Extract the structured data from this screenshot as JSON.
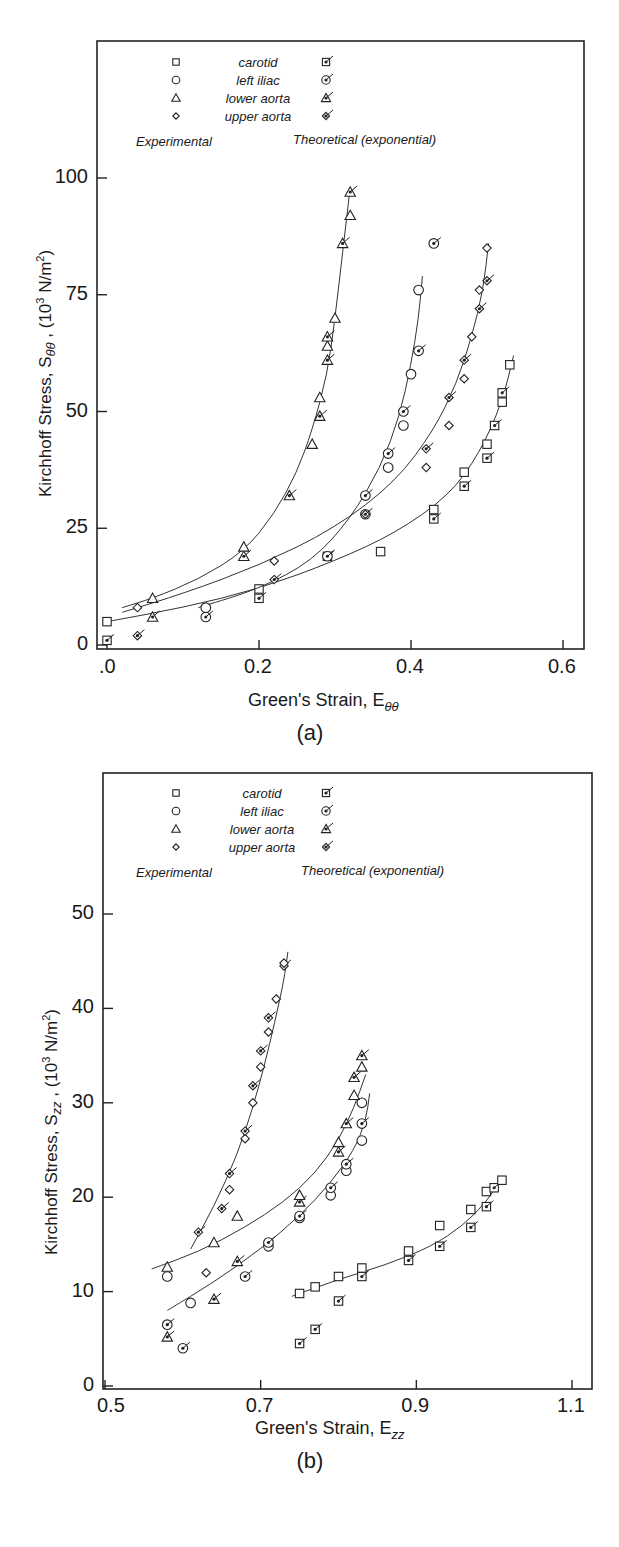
{
  "chart_data": [
    {
      "panel": "(a)",
      "type": "scatter",
      "title": "",
      "xlabel": "Green's Strain, Eθθ",
      "xlabel_main": "Green's Strain, E",
      "xlabel_sub": "θθ",
      "ylabel": "Kirchhoff Stress, Sθθ , (10³ N/m²)",
      "ylabel_main": "Kirchhoff Stress, S",
      "ylabel_sub": "θθ",
      "ylabel_unit": " , (10",
      "ylabel_sup": "3",
      "ylabel_tail": " N/m",
      "ylabel_sup2": "2",
      "ylabel_close": ")",
      "xlim": [
        0.0,
        0.62
      ],
      "ylim": [
        0,
        115
      ],
      "xticks": [
        0.0,
        0.2,
        0.4,
        0.6
      ],
      "xtick_labels": [
        ".0",
        "0.2",
        "0.4",
        "0.6"
      ],
      "yticks": [
        0,
        25,
        50,
        75,
        100
      ],
      "ytick_labels": [
        "0",
        "25",
        "50",
        "75",
        "100"
      ],
      "grid": false,
      "legend": {
        "position": "top-left inside",
        "entries": [
          "carotid",
          "left iliac",
          "lower aorta",
          "upper aorta"
        ],
        "markers": [
          "square",
          "circle",
          "triangle",
          "diamond"
        ],
        "col_experimental": "Experimental",
        "col_theoretical": "Theoretical (exponential)"
      },
      "series": [
        {
          "name": "carotid",
          "marker": "square",
          "x": [
            0.0,
            0.0,
            0.2,
            0.2,
            0.29,
            0.36,
            0.43,
            0.43,
            0.47,
            0.47,
            0.5,
            0.5,
            0.51,
            0.52,
            0.52,
            0.53
          ],
          "y": [
            1,
            5,
            10,
            12,
            19,
            20,
            27,
            29,
            34,
            37,
            40,
            43,
            47,
            52,
            54,
            60
          ],
          "theory_x": [
            0.0,
            0.1,
            0.2,
            0.3,
            0.38,
            0.45,
            0.49,
            0.52,
            0.535
          ],
          "theory_y": [
            5,
            8,
            12,
            18,
            24,
            32,
            41,
            52,
            62
          ]
        },
        {
          "name": "left iliac",
          "marker": "circle",
          "x": [
            0.13,
            0.13,
            0.29,
            0.34,
            0.34,
            0.37,
            0.37,
            0.39,
            0.39,
            0.4,
            0.41,
            0.41,
            0.43
          ],
          "y": [
            6,
            8,
            19,
            28,
            32,
            38,
            41,
            47,
            50,
            58,
            63,
            76,
            86
          ],
          "theory_x": [
            0.12,
            0.2,
            0.27,
            0.32,
            0.36,
            0.385,
            0.4,
            0.41,
            0.415
          ],
          "theory_y": [
            8,
            12,
            18,
            27,
            38,
            49,
            60,
            70,
            79
          ]
        },
        {
          "name": "lower aorta",
          "marker": "triangle",
          "x": [
            0.06,
            0.06,
            0.18,
            0.18,
            0.24,
            0.27,
            0.28,
            0.28,
            0.29,
            0.29,
            0.29,
            0.3,
            0.31,
            0.32,
            0.32
          ],
          "y": [
            6,
            10,
            19,
            21,
            32,
            43,
            49,
            53,
            61,
            64,
            66,
            70,
            86,
            92,
            97
          ],
          "theory_x": [
            0.02,
            0.06,
            0.12,
            0.18,
            0.22,
            0.25,
            0.27,
            0.29,
            0.3,
            0.31,
            0.32
          ],
          "theory_y": [
            8,
            10,
            14,
            20,
            28,
            37,
            46,
            58,
            70,
            84,
            98
          ]
        },
        {
          "name": "upper aorta",
          "marker": "diamond",
          "x": [
            0.04,
            0.04,
            0.22,
            0.22,
            0.34,
            0.42,
            0.42,
            0.45,
            0.45,
            0.47,
            0.47,
            0.48,
            0.49,
            0.49,
            0.5,
            0.5
          ],
          "y": [
            2,
            8,
            14,
            18,
            28,
            38,
            42,
            47,
            53,
            57,
            61,
            66,
            72,
            76,
            78,
            85
          ],
          "theory_x": [
            0.02,
            0.1,
            0.2,
            0.3,
            0.38,
            0.43,
            0.46,
            0.48,
            0.495,
            0.502
          ],
          "theory_y": [
            7,
            11,
            17,
            25,
            35,
            46,
            56,
            66,
            76,
            86
          ]
        }
      ]
    },
    {
      "panel": "(b)",
      "type": "scatter",
      "title": "",
      "xlabel": "Green's Strain, Ezz",
      "xlabel_main": "Green's Strain, E",
      "xlabel_sub": "zz",
      "ylabel": "Kirchhoff Stress, Szz , (10³ N/m²)",
      "ylabel_main": "Kirchhoff Stress, S",
      "ylabel_sub": "zz",
      "ylabel_unit": " , (10",
      "ylabel_sup": "3",
      "ylabel_tail": " N/m",
      "ylabel_sup2": "2",
      "ylabel_close": ")",
      "xlim": [
        0.5,
        1.12
      ],
      "ylim": [
        0,
        59
      ],
      "xticks": [
        0.5,
        0.7,
        0.9,
        1.1
      ],
      "xtick_labels": [
        "0.5",
        "0.7",
        "0.9",
        "1.1"
      ],
      "yticks": [
        0,
        10,
        20,
        30,
        40,
        50
      ],
      "ytick_labels": [
        "0",
        "10",
        "20",
        "30",
        "40",
        "50"
      ],
      "grid": false,
      "legend": {
        "position": "top-left inside",
        "entries": [
          "carotid",
          "left iliac",
          "lower aorta",
          "upper aorta"
        ],
        "markers": [
          "square",
          "circle",
          "triangle",
          "diamond"
        ],
        "col_experimental": "Experimental",
        "col_theoretical": "Theoretical (exponential)"
      },
      "series": [
        {
          "name": "carotid",
          "marker": "square",
          "x": [
            0.75,
            0.75,
            0.77,
            0.77,
            0.8,
            0.8,
            0.83,
            0.83,
            0.89,
            0.89,
            0.93,
            0.93,
            0.97,
            0.97,
            0.99,
            0.99,
            1.0,
            1.01
          ],
          "y": [
            4.5,
            9.8,
            6,
            10.5,
            9,
            11.6,
            11.6,
            12.5,
            13.3,
            14.3,
            14.8,
            17,
            16.8,
            18.7,
            19,
            20.6,
            21,
            21.8
          ],
          "theory_x": [
            0.74,
            0.8,
            0.86,
            0.92,
            0.96,
            0.99,
            1.01
          ],
          "theory_y": [
            9.5,
            11.3,
            12.8,
            14.8,
            17,
            19.5,
            22
          ]
        },
        {
          "name": "left iliac",
          "marker": "circle",
          "x": [
            0.58,
            0.58,
            0.6,
            0.61,
            0.68,
            0.71,
            0.71,
            0.75,
            0.75,
            0.79,
            0.79,
            0.81,
            0.81,
            0.83,
            0.83,
            0.83
          ],
          "y": [
            6.5,
            11.6,
            4,
            8.8,
            11.6,
            14.8,
            15.2,
            17.8,
            18,
            20.2,
            21,
            22.8,
            23.5,
            26,
            27.8,
            30
          ],
          "theory_x": [
            0.58,
            0.64,
            0.7,
            0.75,
            0.79,
            0.82,
            0.835,
            0.84
          ],
          "theory_y": [
            8,
            11,
            14.5,
            18,
            21.5,
            25,
            28,
            31
          ]
        },
        {
          "name": "lower aorta",
          "marker": "triangle",
          "x": [
            0.58,
            0.58,
            0.64,
            0.64,
            0.67,
            0.67,
            0.75,
            0.75,
            0.8,
            0.8,
            0.81,
            0.82,
            0.82,
            0.83,
            0.83
          ],
          "y": [
            5.2,
            12.6,
            9.2,
            15.2,
            13.2,
            18,
            19.5,
            20.2,
            24.8,
            25.8,
            27.8,
            30.8,
            32.7,
            33.8,
            35
          ],
          "theory_x": [
            0.56,
            0.62,
            0.68,
            0.73,
            0.77,
            0.8,
            0.82,
            0.835
          ],
          "theory_y": [
            12.4,
            14.2,
            16.8,
            19.5,
            22.5,
            26,
            29.5,
            33
          ]
        },
        {
          "name": "upper aorta",
          "marker": "diamond",
          "x": [
            0.62,
            0.63,
            0.65,
            0.66,
            0.66,
            0.68,
            0.68,
            0.69,
            0.69,
            0.7,
            0.7,
            0.71,
            0.71,
            0.72,
            0.73,
            0.73
          ],
          "y": [
            16.3,
            12,
            18.8,
            20.8,
            22.5,
            26.2,
            27,
            30,
            31.8,
            33.8,
            35.5,
            37.5,
            39,
            41,
            44.5,
            44.8
          ],
          "theory_x": [
            0.61,
            0.64,
            0.67,
            0.69,
            0.705,
            0.718,
            0.73,
            0.735
          ],
          "theory_y": [
            14.5,
            19,
            24.5,
            29.5,
            34,
            38.5,
            43,
            46
          ]
        }
      ]
    }
  ],
  "figures": [
    {
      "panel_label": "(a)"
    },
    {
      "panel_label": "(b)"
    }
  ]
}
